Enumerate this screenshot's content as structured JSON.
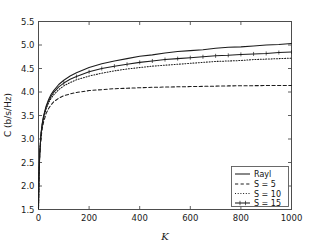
{
  "chart_data": {
    "type": "line",
    "title": "",
    "xlabel": "K",
    "ylabel": "C (b/s/Hz)",
    "xlim": [
      0,
      1000
    ],
    "ylim": [
      1.5,
      5.5
    ],
    "xticks": [
      0,
      200,
      400,
      600,
      800,
      1000
    ],
    "xtick_labels": [
      "0",
      "200",
      "400",
      "600",
      "800",
      "1000"
    ],
    "yticks": [
      1.5,
      2.0,
      2.5,
      3.0,
      3.5,
      4.0,
      4.5,
      5.0,
      5.5
    ],
    "ytick_labels": [
      "1.5",
      "2.0",
      "2.5",
      "3.0",
      "3.5",
      "4.0",
      "4.5",
      "5.0",
      "5.5"
    ],
    "grid": false,
    "legend_position": "lower right",
    "x": [
      0,
      2,
      5,
      10,
      15,
      20,
      30,
      40,
      50,
      60,
      80,
      100,
      125,
      150,
      200,
      250,
      300,
      350,
      400,
      450,
      500,
      550,
      600,
      650,
      700,
      750,
      800,
      850,
      900,
      950,
      1000
    ],
    "series": [
      {
        "name": "Rayl",
        "style": "solid",
        "marker": "none",
        "values": [
          1.52,
          2.25,
          2.72,
          3.12,
          3.34,
          3.49,
          3.7,
          3.84,
          3.95,
          4.03,
          4.16,
          4.25,
          4.34,
          4.41,
          4.52,
          4.6,
          4.66,
          4.71,
          4.76,
          4.79,
          4.83,
          4.86,
          4.88,
          4.9,
          4.93,
          4.95,
          4.96,
          4.98,
          5.0,
          5.01,
          5.03
        ]
      },
      {
        "name": "S = 5",
        "style": "dashed",
        "marker": "none",
        "values": [
          1.52,
          2.22,
          2.66,
          3.03,
          3.23,
          3.36,
          3.54,
          3.65,
          3.73,
          3.79,
          3.87,
          3.92,
          3.96,
          3.99,
          4.03,
          4.05,
          4.07,
          4.08,
          4.09,
          4.1,
          4.105,
          4.11,
          4.115,
          4.12,
          4.125,
          4.13,
          4.132,
          4.135,
          4.137,
          4.139,
          4.14
        ]
      },
      {
        "name": "S = 10",
        "style": "dotted",
        "marker": "none",
        "values": [
          1.52,
          2.24,
          2.7,
          3.09,
          3.3,
          3.44,
          3.64,
          3.77,
          3.87,
          3.94,
          4.05,
          4.13,
          4.2,
          4.26,
          4.34,
          4.4,
          4.45,
          4.49,
          4.52,
          4.55,
          4.57,
          4.59,
          4.61,
          4.63,
          4.65,
          4.66,
          4.67,
          4.69,
          4.7,
          4.71,
          4.72
        ]
      },
      {
        "name": "S = 15",
        "style": "solid-marker",
        "marker": "plus",
        "values": [
          1.52,
          2.25,
          2.71,
          3.11,
          3.32,
          3.47,
          3.67,
          3.81,
          3.91,
          3.99,
          4.11,
          4.19,
          4.27,
          4.33,
          4.43,
          4.5,
          4.55,
          4.59,
          4.63,
          4.66,
          4.69,
          4.71,
          4.73,
          4.75,
          4.77,
          4.78,
          4.8,
          4.81,
          4.82,
          4.84,
          4.85
        ]
      }
    ]
  },
  "legend": {
    "entries": [
      {
        "label": "Rayl"
      },
      {
        "label": "S = 5"
      },
      {
        "label": "S = 10"
      },
      {
        "label": "S = 15"
      }
    ]
  },
  "colors": {
    "line": "#1c1c1c",
    "axis": "#4d4d4d",
    "background": "#ffffff"
  }
}
